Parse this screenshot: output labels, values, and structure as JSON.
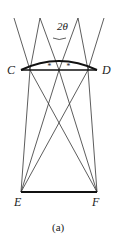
{
  "figure": {
    "caption": "(a)",
    "angle_label": "2θ",
    "points": {
      "C": {
        "label": "C",
        "x": 21,
        "y": 70
      },
      "D": {
        "label": "D",
        "x": 97,
        "y": 70
      },
      "E": {
        "label": "E",
        "x": 21,
        "y": 192
      },
      "F": {
        "label": "F",
        "x": 97,
        "y": 192
      }
    },
    "lens": {
      "flat_y": 70,
      "arc_peak_y": 61,
      "marks": [
        "*",
        "*"
      ]
    },
    "colors": {
      "line": "#333333",
      "thick": "#111111",
      "background": "#ffffff"
    }
  }
}
